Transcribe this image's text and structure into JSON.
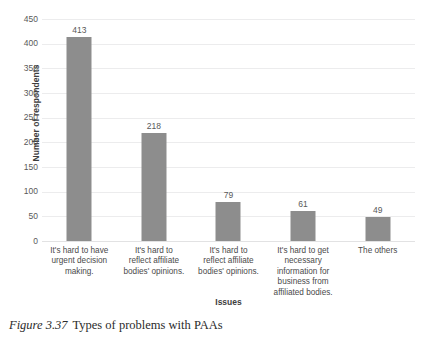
{
  "caption": {
    "number": "Figure 3.37",
    "text": "Types of problems with PAAs"
  },
  "chart_data": {
    "type": "bar",
    "title": "",
    "xlabel": "Issues",
    "ylabel": "Number of respondents",
    "ylim": [
      0,
      450
    ],
    "ytick_step": 50,
    "yticks": [
      "450",
      "400",
      "350",
      "300",
      "250",
      "200",
      "150",
      "100",
      "50",
      "0"
    ],
    "grid": true,
    "legend": false,
    "bar_color": "#8d8d8d",
    "gridline_color": "#ececed",
    "categories": [
      "It's hard to have urgent decision making.",
      "It's hard to reflect affiliate bodies' opinions.",
      "It's hard to reflect affiliate bodies' opinions.",
      "It's hard to get necessary information for business from affiliated bodies.",
      "The others"
    ],
    "category_lines": [
      [
        "It's hard to have",
        "urgent decision",
        "making."
      ],
      [
        "It's hard to",
        "reflect affiliate",
        "bodies' opinions."
      ],
      [
        "It's hard to",
        "reflect affiliate",
        "bodies' opinions."
      ],
      [
        "It's hard to get",
        "necessary",
        "information for",
        "business from",
        "affiliated bodies."
      ],
      [
        "The others"
      ]
    ],
    "values": [
      413,
      218,
      79,
      61,
      49
    ],
    "value_labels": [
      "413",
      "218",
      "79",
      "61",
      "49"
    ]
  }
}
